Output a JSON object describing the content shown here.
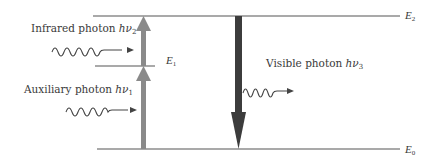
{
  "diagram": {
    "levels": [
      {
        "id": "E2",
        "label_symbol": "E",
        "label_sub": "2",
        "y": 16,
        "x1": 93,
        "x2": 400
      },
      {
        "id": "E1",
        "label_symbol": "E",
        "label_sub": "1",
        "y": 66,
        "x1": 95,
        "x2": 155
      },
      {
        "id": "E0",
        "label_symbol": "E",
        "label_sub": "0",
        "y": 149,
        "x1": 97,
        "x2": 400
      }
    ],
    "photons": {
      "infrared": {
        "text": "Infrared photon ",
        "symbol": "hν",
        "sub": "2"
      },
      "auxiliary": {
        "text": "Auxiliary photon ",
        "symbol": "hν",
        "sub": "1"
      },
      "visible": {
        "text": "Visible photon ",
        "symbol": "hν",
        "sub": "3"
      }
    },
    "transitions": [
      {
        "name": "auxiliary-absorption",
        "from": "E0",
        "to": "E1",
        "direction": "up",
        "color": "#8a8a8a"
      },
      {
        "name": "infrared-absorption",
        "from": "E1",
        "to": "E2",
        "direction": "up",
        "color": "#8a8a8a"
      },
      {
        "name": "visible-emission",
        "from": "E2",
        "to": "E0",
        "direction": "down",
        "color": "#3c3c3c"
      }
    ],
    "colors": {
      "level_line": "#555555",
      "up_arrow": "#8a8a8a",
      "down_arrow": "#3c3c3c",
      "wave": "#444444",
      "text": "#3a3a3a"
    }
  }
}
